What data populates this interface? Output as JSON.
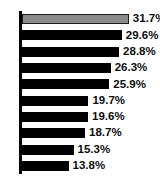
{
  "clipped_legend": {
    "fragment_left": "",
    "fragment_right": ""
  },
  "chart_data": {
    "type": "bar",
    "orientation": "horizontal",
    "title": "",
    "subtitle": "",
    "xlabel": "",
    "ylabel": "",
    "grid": false,
    "legend_position": "top",
    "axis": {
      "visible_axes": [
        "y"
      ],
      "xlim": [
        0,
        35
      ]
    },
    "categories": [
      "",
      "",
      "",
      "",
      "",
      "",
      "",
      "",
      "",
      ""
    ],
    "values": [
      31.7,
      29.6,
      28.8,
      26.3,
      25.9,
      19.7,
      19.6,
      18.7,
      15.3,
      13.8
    ],
    "data_labels": [
      "31.7%",
      "29.6%",
      "28.8%",
      "26.3%",
      "25.9%",
      "19.7%",
      "19.6%",
      "18.7%",
      "15.3%",
      "13.8%"
    ],
    "colors": {
      "highlight_bar": "#8a8a8a",
      "bar": "#000000",
      "bar_outline": "#1a1a1a",
      "axis": "#000000",
      "label_text": "#0d0d0d",
      "background": "#ffffff"
    },
    "highlight_index": 0
  }
}
